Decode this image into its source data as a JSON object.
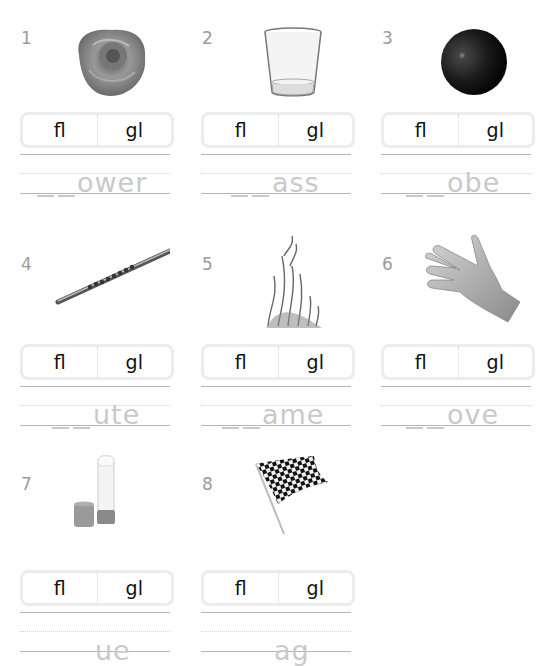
{
  "worksheet": {
    "choices": [
      "fl",
      "gl"
    ],
    "items": [
      {
        "number": "1",
        "picture": "rose",
        "ending": "ower"
      },
      {
        "number": "2",
        "picture": "glass",
        "ending": "ass"
      },
      {
        "number": "3",
        "picture": "globe-ball",
        "ending": "obe"
      },
      {
        "number": "4",
        "picture": "flute",
        "ending": "ute"
      },
      {
        "number": "5",
        "picture": "flame",
        "ending": "ame"
      },
      {
        "number": "6",
        "picture": "glove",
        "ending": "ove"
      },
      {
        "number": "7",
        "picture": "glue-stick",
        "ending": "ue"
      },
      {
        "number": "8",
        "picture": "checkered-flag",
        "ending": "ag"
      }
    ]
  },
  "colors": {
    "number": "#9a9a9a",
    "choice_text": "#111111",
    "choice_border": "#ececec",
    "word_ending": "#c9c9c9",
    "rule_line": "#b5b5b5"
  }
}
